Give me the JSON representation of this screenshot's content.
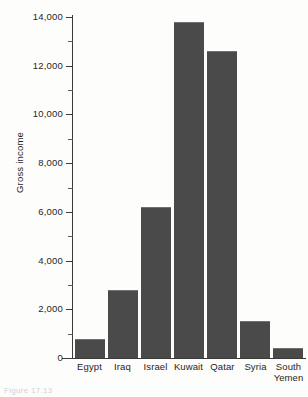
{
  "chart_data": {
    "type": "bar",
    "title": "",
    "xlabel": "",
    "ylabel": "Gross income",
    "categories": [
      "Egypt",
      "Iraq",
      "Israel",
      "Kuwait",
      "Qatar",
      "Syria",
      "South Yemen"
    ],
    "values": [
      780,
      2800,
      6200,
      13800,
      12600,
      1520,
      420
    ],
    "ylim": [
      0,
      14000
    ],
    "ytick_labels": [
      "0",
      "2,000",
      "4,000",
      "6,000",
      "8,000",
      "10,000",
      "12,000",
      "14,000"
    ],
    "ytick_values": [
      0,
      2000,
      4000,
      6000,
      8000,
      10000,
      12000,
      14000
    ],
    "minor_tick_values": [
      1000,
      3000,
      5000,
      7000,
      9000,
      11000,
      13000
    ],
    "grid": false,
    "legend": false,
    "bar_color": "#4a4a4a",
    "axis_color": "#3b3b3b",
    "background_color": "#fdfdfb"
  },
  "axis": {
    "y_title": "Gross income"
  },
  "caption": {
    "text": "Figure 17.13"
  }
}
